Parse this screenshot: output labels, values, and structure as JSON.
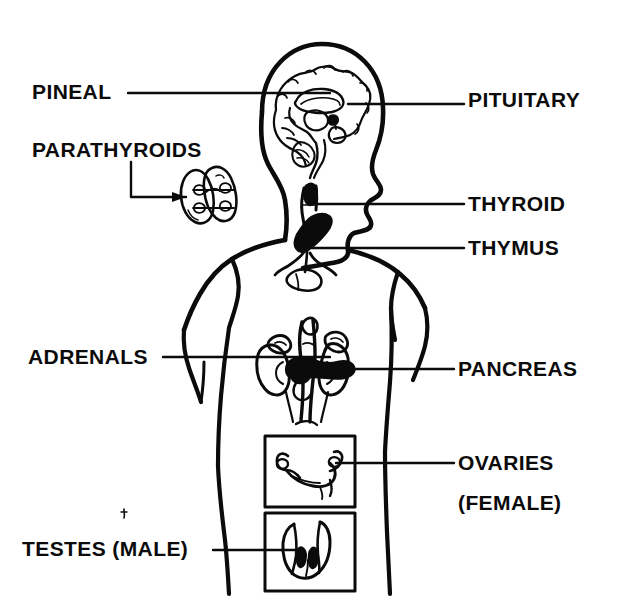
{
  "diagram": {
    "type": "anatomical-line-diagram",
    "background_color": "#ffffff",
    "ink_color": "#0b0b0b",
    "figure": "human body in right-facing profile, head and torso, line art"
  },
  "labels": {
    "pineal": "PINEAL",
    "parathyroids": "PARATHYROIDS",
    "pituitary": "PITUITARY",
    "thyroid": "THYROID",
    "thymus": "THYMUS",
    "adrenals": "ADRENALS",
    "pancreas": "PANCREAS",
    "ovaries": "OVARIES",
    "ovaries_sub": "(FEMALE)",
    "testes": "TESTES (MALE)"
  },
  "glands": [
    {
      "name": "PINEAL",
      "side": "left",
      "label_x": 32,
      "label_y": 80,
      "leader_from": [
        128,
        93
      ],
      "leader_to": [
        312,
        93
      ]
    },
    {
      "name": "PARATHYROIDS",
      "side": "left",
      "label_x": 32,
      "label_y": 140,
      "leader_from": [
        131,
        160
      ],
      "leader_to": [
        131,
        197
      ],
      "leader_to2": [
        176,
        197
      ]
    },
    {
      "name": "PITUITARY",
      "side": "right",
      "label_x": 468,
      "label_y": 88,
      "leader_from": [
        348,
        104
      ],
      "leader_to": [
        464,
        104
      ]
    },
    {
      "name": "THYROID",
      "side": "right",
      "label_x": 468,
      "label_y": 195,
      "leader_from": [
        324,
        204
      ],
      "leader_to": [
        464,
        204
      ]
    },
    {
      "name": "THYMUS",
      "side": "right",
      "label_x": 468,
      "label_y": 238,
      "leader_from": [
        320,
        248
      ],
      "leader_to": [
        464,
        248
      ]
    },
    {
      "name": "ADRENALS",
      "side": "left",
      "label_x": 28,
      "label_y": 348,
      "leader_from": [
        163,
        357
      ],
      "leader_to": [
        300,
        357
      ]
    },
    {
      "name": "PANCREAS",
      "side": "right",
      "label_x": 458,
      "label_y": 360,
      "leader_from": [
        352,
        369
      ],
      "leader_to": [
        454,
        369
      ]
    },
    {
      "name": "OVARIES",
      "side": "right",
      "label_x": 458,
      "label_y": 452,
      "leader_from": [
        332,
        463
      ],
      "leader_to": [
        454,
        463
      ]
    },
    {
      "name": "TESTES (MALE)",
      "side": "left",
      "label_x": 22,
      "label_y": 540,
      "leader_from": [
        213,
        550
      ],
      "leader_to": [
        290,
        550
      ]
    }
  ],
  "insets": [
    {
      "name": "ovaries-inset-box",
      "x": 265,
      "y": 436,
      "w": 90,
      "h": 71
    },
    {
      "name": "testes-inset-box",
      "x": 265,
      "y": 513,
      "w": 90,
      "h": 78
    },
    {
      "name": "parathyroids-inset",
      "x": 178,
      "y": 163,
      "w": 62,
      "h": 65
    }
  ]
}
